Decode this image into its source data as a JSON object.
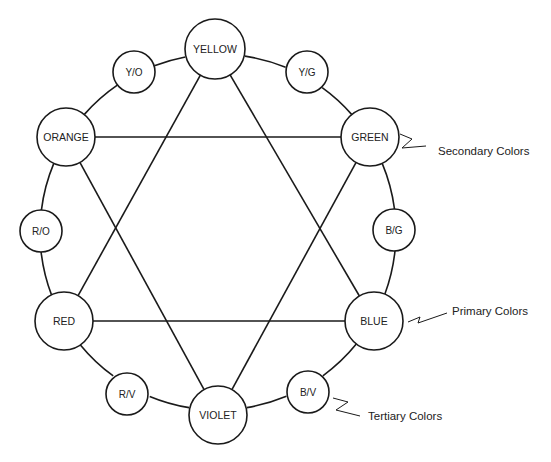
{
  "diagram": {
    "type": "color-wheel",
    "stroke_color": "#1a1a1a",
    "background": "#ffffff",
    "wheel": {
      "cx": 218,
      "cy": 232,
      "r": 178
    },
    "nodes": [
      {
        "id": "yellow",
        "label": "YELLOW",
        "x": 215,
        "y": 49,
        "r": 30,
        "kind": "primary"
      },
      {
        "id": "yg",
        "label": "Y/G",
        "x": 307,
        "y": 72,
        "r": 21,
        "kind": "tertiary"
      },
      {
        "id": "green",
        "label": "GREEN",
        "x": 370,
        "y": 137,
        "r": 29,
        "kind": "secondary"
      },
      {
        "id": "bg",
        "label": "B/G",
        "x": 394,
        "y": 230,
        "r": 21,
        "kind": "tertiary"
      },
      {
        "id": "blue",
        "label": "BLUE",
        "x": 374,
        "y": 321,
        "r": 29,
        "kind": "primary"
      },
      {
        "id": "bv",
        "label": "B/V",
        "x": 308,
        "y": 392,
        "r": 21,
        "kind": "tertiary"
      },
      {
        "id": "violet",
        "label": "VIOLET",
        "x": 218,
        "y": 415,
        "r": 29,
        "kind": "secondary"
      },
      {
        "id": "rv",
        "label": "R/V",
        "x": 127,
        "y": 394,
        "r": 21,
        "kind": "tertiary"
      },
      {
        "id": "red",
        "label": "RED",
        "x": 64,
        "y": 321,
        "r": 29,
        "kind": "primary"
      },
      {
        "id": "ro",
        "label": "R/O",
        "x": 41,
        "y": 231,
        "r": 21,
        "kind": "tertiary"
      },
      {
        "id": "orange",
        "label": "ORANGE",
        "x": 66,
        "y": 137,
        "r": 29,
        "kind": "secondary"
      },
      {
        "id": "yo",
        "label": "Y/O",
        "x": 134,
        "y": 72,
        "r": 21,
        "kind": "tertiary"
      }
    ],
    "triangles": [
      {
        "name": "primary-triangle",
        "nodes": [
          "yellow",
          "blue",
          "red"
        ]
      },
      {
        "name": "secondary-triangle",
        "nodes": [
          "orange",
          "green",
          "violet"
        ]
      }
    ],
    "callouts": [
      {
        "id": "secondary",
        "label": "Secondary Colors",
        "target": "green",
        "text_x": 438,
        "text_y": 151
      },
      {
        "id": "primary",
        "label": "Primary Colors",
        "target": "blue",
        "text_x": 452,
        "text_y": 311
      },
      {
        "id": "tertiary",
        "label": "Tertiary Colors",
        "target": "bv",
        "text_x": 368,
        "text_y": 416
      }
    ]
  }
}
